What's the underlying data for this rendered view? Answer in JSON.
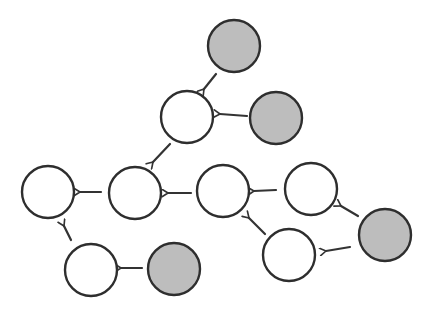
{
  "diagram": {
    "type": "directed-graph",
    "style": "hand-drawn",
    "colors": {
      "stroke": "#2e2e2e",
      "shaded_fill": "#bdbdbd",
      "white_fill": "#ffffff",
      "background": "#ffffff"
    },
    "node_radius": 26,
    "nodes": [
      {
        "id": "n1",
        "kind": "shaded",
        "cx": 234,
        "cy": 46
      },
      {
        "id": "n2",
        "kind": "white",
        "cx": 187,
        "cy": 117
      },
      {
        "id": "n3",
        "kind": "shaded",
        "cx": 276,
        "cy": 118
      },
      {
        "id": "n4",
        "kind": "white",
        "cx": 48,
        "cy": 192
      },
      {
        "id": "n5",
        "kind": "white",
        "cx": 135,
        "cy": 193
      },
      {
        "id": "n6",
        "kind": "white",
        "cx": 223,
        "cy": 191
      },
      {
        "id": "n7",
        "kind": "white",
        "cx": 311,
        "cy": 189
      },
      {
        "id": "n8",
        "kind": "shaded",
        "cx": 385,
        "cy": 235
      },
      {
        "id": "n9",
        "kind": "white",
        "cx": 289,
        "cy": 255
      },
      {
        "id": "n10",
        "kind": "white",
        "cx": 91,
        "cy": 270
      },
      {
        "id": "n11",
        "kind": "shaded",
        "cx": 174,
        "cy": 269
      }
    ],
    "edges": [
      {
        "from": "n1",
        "to": "n2",
        "x1": 216,
        "y1": 74,
        "x2": 204,
        "y2": 89
      },
      {
        "from": "n3",
        "to": "n2",
        "x1": 247,
        "y1": 116,
        "x2": 220,
        "y2": 114
      },
      {
        "from": "n2",
        "to": "n5",
        "x1": 170,
        "y1": 144,
        "x2": 153,
        "y2": 162
      },
      {
        "from": "n5",
        "to": "n4",
        "x1": 101,
        "y1": 192,
        "x2": 80,
        "y2": 192
      },
      {
        "from": "n6",
        "to": "n5",
        "x1": 191,
        "y1": 193,
        "x2": 168,
        "y2": 193
      },
      {
        "from": "n7",
        "to": "n6",
        "x1": 276,
        "y1": 190,
        "x2": 254,
        "y2": 191
      },
      {
        "from": "n9",
        "to": "n6",
        "x1": 265,
        "y1": 234,
        "x2": 249,
        "y2": 218
      },
      {
        "from": "n8",
        "to": "n7",
        "x1": 358,
        "y1": 216,
        "x2": 341,
        "y2": 206
      },
      {
        "from": "n8",
        "to": "n9",
        "x1": 350,
        "y1": 247,
        "x2": 326,
        "y2": 251
      },
      {
        "from": "n10",
        "to": "n4",
        "x1": 71,
        "y1": 240,
        "x2": 64,
        "y2": 226
      },
      {
        "from": "n11",
        "to": "n10",
        "x1": 142,
        "y1": 268,
        "x2": 121,
        "y2": 268
      }
    ]
  }
}
